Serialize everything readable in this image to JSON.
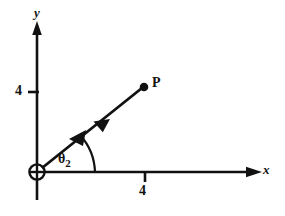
{
  "figure": {
    "background_color": "#ffffff",
    "ink_color": "#111111"
  },
  "axes": {
    "x_axis": {
      "label": "x",
      "icon": "arrow-right-icon",
      "start_px": 37,
      "end_px": 262,
      "y_px": 172
    },
    "y_axis": {
      "label": "y",
      "icon": "arrow-up-icon",
      "start_px": 200,
      "end_px": 23,
      "x_px": 37
    },
    "origin": {
      "marker": "circled-cross-icon",
      "x_px": 37,
      "y_px": 172,
      "radius_px": 8
    }
  },
  "ticks": {
    "x": [
      {
        "label": "4",
        "value": 4,
        "x_px": 145
      }
    ],
    "y": [
      {
        "label": "4",
        "value": 4,
        "y_px": 92
      }
    ]
  },
  "ray": {
    "label": "P",
    "point_label": "P",
    "from": {
      "x_px": 40,
      "y_px": 169
    },
    "to": {
      "x_px": 144,
      "y_px": 87
    },
    "direction_arrow": "arrow-up-right-icon",
    "endpoint_marker": "filled-dot-icon"
  },
  "angle": {
    "symbol": "θ",
    "subscript": "2",
    "arc_icon": "angle-arc-arrow-icon",
    "arc_radius_px": 58,
    "from_deg": 0,
    "to_deg": 38
  }
}
